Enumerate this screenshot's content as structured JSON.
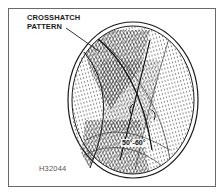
{
  "figure": {
    "callout_line1": "CROSSHATCH",
    "callout_line2": "PATTERN",
    "angle_label": "50°-60°",
    "figure_id": "H32044"
  },
  "colors": {
    "ink": "#1a1a1a",
    "frame": "#6a6a6a",
    "background": "#ffffff"
  }
}
